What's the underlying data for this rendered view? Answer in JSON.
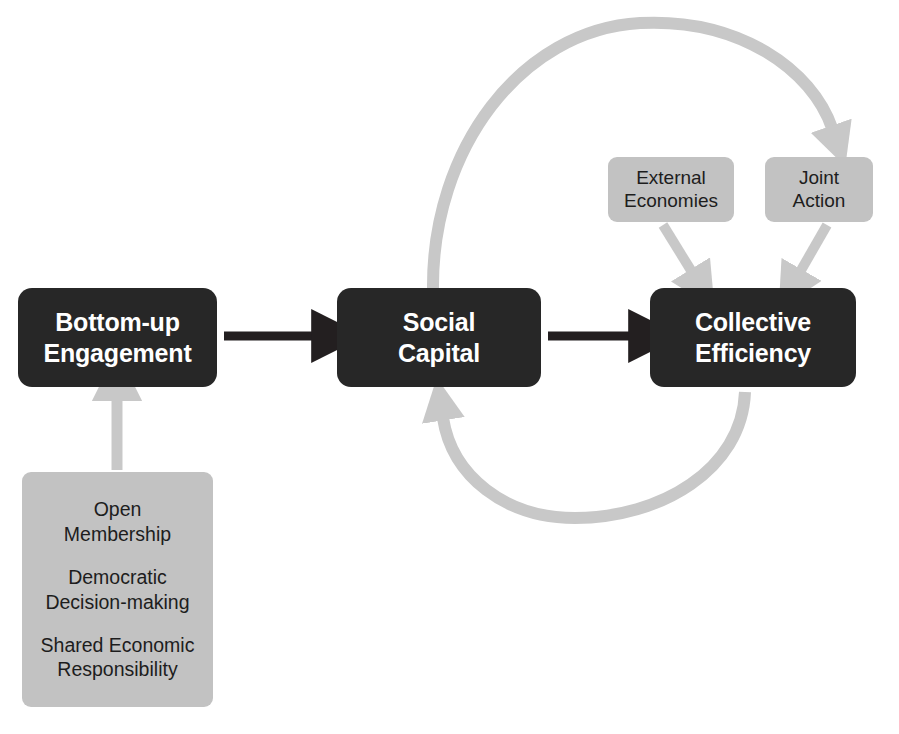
{
  "page": {
    "cut_off_header": "",
    "background_color": "#ffffff"
  },
  "colors": {
    "dark_node": "#272727",
    "dark_node_text": "#ffffff",
    "gray_node": "#c2c2c2",
    "gray_node_text": "#1d1d1d",
    "black_arrow": "#231f20",
    "gray_arrow": "#c8c8c8"
  },
  "diagram": {
    "type": "flow-diagram",
    "title": "",
    "main_chain": [
      {
        "id": "bottom-up-engagement",
        "label": "Bottom-up\nEngagement",
        "line1": "Bottom-up",
        "line2": "Engagement",
        "style": "dark"
      },
      {
        "id": "social-capital",
        "label": "Social\nCapital",
        "line1": "Social",
        "line2": "Capital",
        "style": "dark"
      },
      {
        "id": "collective-efficiency",
        "label": "Collective\nEfficiency",
        "line1": "Collective",
        "line2": "Efficiency",
        "style": "dark"
      }
    ],
    "secondary_nodes": [
      {
        "id": "external-economies",
        "line1": "External",
        "line2": "Economies",
        "style": "gray"
      },
      {
        "id": "joint-action",
        "line1": "Joint",
        "line2": "Action",
        "style": "gray"
      }
    ],
    "principles_node": {
      "id": "cooperative-principles",
      "style": "gray",
      "items": [
        {
          "line1": "Open",
          "line2": "Membership"
        },
        {
          "line1": "Democratic",
          "line2": "Decision-making"
        },
        {
          "line1": "Shared Economic",
          "line2": "Responsibility"
        }
      ]
    },
    "connectors": [
      {
        "id": "engagement-to-capital",
        "from": "bottom-up-engagement",
        "to": "social-capital",
        "style": "black-straight",
        "direction": "right"
      },
      {
        "id": "capital-to-efficiency",
        "from": "social-capital",
        "to": "collective-efficiency",
        "style": "black-straight",
        "direction": "right"
      },
      {
        "id": "principles-to-engagement",
        "from": "cooperative-principles",
        "to": "bottom-up-engagement",
        "style": "gray-straight",
        "direction": "up"
      },
      {
        "id": "external-economies-to-efficiency",
        "from": "external-economies",
        "to": "collective-efficiency",
        "style": "gray-straight",
        "direction": "down-right"
      },
      {
        "id": "joint-action-to-efficiency",
        "from": "joint-action",
        "to": "collective-efficiency",
        "style": "gray-straight",
        "direction": "down-left"
      },
      {
        "id": "capital-to-efficiency-loop-top",
        "from": "social-capital",
        "to": "collective-efficiency",
        "style": "gray-arc",
        "direction": "clockwise-over-top"
      },
      {
        "id": "efficiency-to-capital-loop-bottom",
        "from": "collective-efficiency",
        "to": "social-capital",
        "style": "gray-arc",
        "direction": "clockwise-under-bottom"
      }
    ]
  }
}
